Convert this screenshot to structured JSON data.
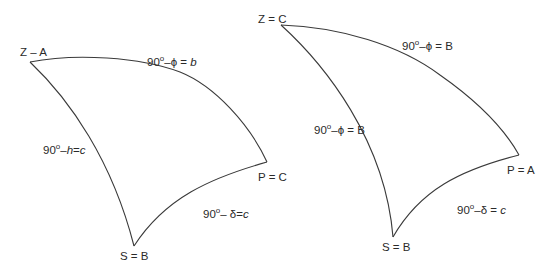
{
  "diagram": {
    "triangles": [
      {
        "id": "left",
        "vertices": {
          "zenith": {
            "label": "Z – A",
            "x": 30,
            "y": 62
          },
          "pole": {
            "label": "P = C",
            "x": 267,
            "y": 162
          },
          "star": {
            "label": "S = B",
            "x": 134,
            "y": 246
          }
        },
        "edges": {
          "zenith_pole": {
            "prefix": "90",
            "deg": "o",
            "dash": "–",
            "sym": "ϕ",
            "eq": " = ",
            "var": "b",
            "var_italic": true
          },
          "zenith_star": {
            "prefix": "90",
            "deg": "o",
            "dash": "–",
            "sym": "h",
            "sym_italic": true,
            "eq": "=",
            "var": "c",
            "var_italic": true
          },
          "pole_star": {
            "prefix": "90",
            "deg": "o",
            "dash": "– ",
            "sym": "δ",
            "eq": "=",
            "var": "c",
            "var_italic": true
          }
        }
      },
      {
        "id": "right",
        "vertices": {
          "zenith": {
            "label": "Z = C",
            "x": 281,
            "y": 25
          },
          "pole": {
            "label": "P = A",
            "x": 519,
            "y": 155
          },
          "star": {
            "label": "S = B",
            "x": 393,
            "y": 237
          }
        },
        "edges": {
          "zenith_pole": {
            "prefix": "90",
            "deg": "o",
            "dash": "–",
            "sym": "ϕ",
            "eq": " = ",
            "var": "B",
            "var_italic": false
          },
          "zenith_star": {
            "prefix": "90",
            "deg": "o",
            "dash": "–",
            "sym": "ϕ",
            "eq": " = ",
            "var": "B",
            "var_italic": false
          },
          "pole_star": {
            "prefix": "90",
            "deg": "o",
            "dash": "–",
            "sym": "δ",
            "eq": " = ",
            "var": "c",
            "var_italic": true
          }
        }
      }
    ],
    "colors": {
      "stroke": "#3a3a3a",
      "text": "#2a2a2a",
      "background": "#ffffff"
    }
  }
}
